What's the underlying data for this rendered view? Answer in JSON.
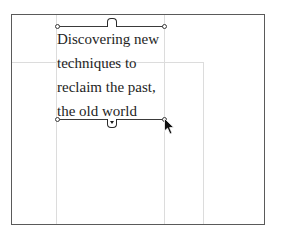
{
  "canvas": {
    "frame_color": "#5a5a5a",
    "guide_color": "#dcdcdc",
    "text_color": "#1e1e1e"
  },
  "text_frame": {
    "lines": [
      "Discovering new",
      "techniques to",
      "reclaim the past,",
      "the old world"
    ]
  },
  "ports": {
    "in_port": "in-port",
    "out_port": "out-port-overset"
  },
  "cursor": {
    "type": "arrow-pointer"
  }
}
